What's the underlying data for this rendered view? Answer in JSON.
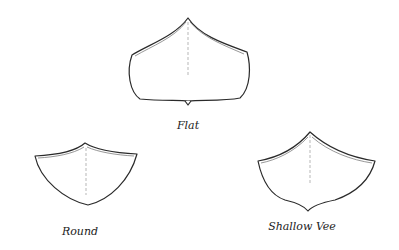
{
  "diagram": {
    "hulls": [
      {
        "id": "flat",
        "label": "Flat"
      },
      {
        "id": "round",
        "label": "Round"
      },
      {
        "id": "shallow-vee",
        "label": "Shallow Vee"
      }
    ],
    "colors": {
      "background": "#ffffff",
      "line": "#2a2a2a"
    }
  }
}
